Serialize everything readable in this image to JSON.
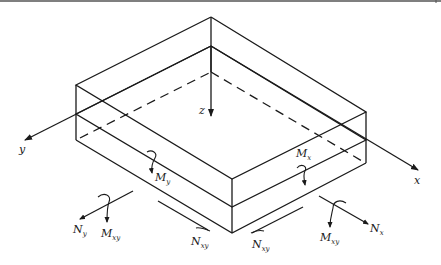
{
  "figure": {
    "axes": {
      "x": {
        "label": "x"
      },
      "y": {
        "label": "y"
      },
      "z": {
        "label": "z"
      }
    },
    "labels": {
      "Mx": {
        "main": "M",
        "sub": "x"
      },
      "My": {
        "main": "M",
        "sub": "y"
      },
      "Mxy_left": {
        "main": "M",
        "sub": "xy"
      },
      "Mxy_right": {
        "main": "M",
        "sub": "xy"
      },
      "Nx": {
        "main": "N",
        "sub": "x"
      },
      "Ny": {
        "main": "N",
        "sub": "y"
      },
      "Nxy_left": {
        "main": "N",
        "sub": "xy"
      },
      "Nxy_right": {
        "main": "N",
        "sub": "xy"
      }
    },
    "colors": {
      "line": "#1a1a1a",
      "background": "#ffffff"
    }
  }
}
